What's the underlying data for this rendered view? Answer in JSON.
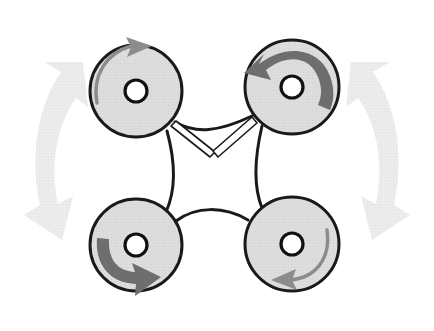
{
  "figure": {
    "name": "quadrotor-rotation-diagram",
    "background_color": "#ffffff",
    "width": 434,
    "height": 331,
    "caption": ""
  },
  "style": {
    "rotor_fill": "#dcdcdc",
    "rotor_stroke": "#1a1a1a",
    "rotor_stroke_width": 3,
    "hub_fill": "#ffffff",
    "hub_stroke": "#111111",
    "hub_stroke_width": 3.2,
    "frame_stroke": "#1a1a1a",
    "frame_stroke_width": 3,
    "strut_fill": "#ffffff",
    "strut_stroke": "#1a1a1a",
    "strut_stroke_width": 1.6,
    "thin_arrow_color": "#8c8c8c",
    "thick_arrow_color": "#6e6e6e",
    "yaw_arrow_color": "#e9e9e9"
  },
  "rotors": [
    {
      "id": "rotor-front-left",
      "label": "Front Left Rotor",
      "position": "top-left",
      "cx": 136,
      "cy": 91,
      "r": 46,
      "hub_r": 11,
      "spin": "clockwise",
      "arrow_style": "thin",
      "arrow_color": "#8c8c8c"
    },
    {
      "id": "rotor-front-right",
      "label": "Front Right Rotor",
      "position": "top-right",
      "cx": 292,
      "cy": 87,
      "r": 47,
      "hub_r": 11,
      "spin": "counter-clockwise",
      "arrow_style": "thick",
      "arrow_color": "#6e6e6e"
    },
    {
      "id": "rotor-rear-left",
      "label": "Rear Left Rotor",
      "position": "bottom-left",
      "cx": 136,
      "cy": 245,
      "r": 46,
      "hub_r": 11,
      "spin": "counter-clockwise",
      "arrow_style": "thick",
      "arrow_color": "#6e6e6e"
    },
    {
      "id": "rotor-rear-right",
      "label": "Rear Right Rotor",
      "position": "bottom-right",
      "cx": 292,
      "cy": 244,
      "r": 47,
      "hub_r": 11,
      "spin": "clockwise",
      "arrow_style": "thin",
      "arrow_color": "#8c8c8c"
    }
  ],
  "frame": {
    "label": "Airframe Body",
    "description": "Concave arc body linking the four rotor mounts",
    "struts": [
      {
        "id": "strut-left",
        "label": "Left Diagonal Strut"
      },
      {
        "id": "strut-right",
        "label": "Right Diagonal Strut"
      }
    ]
  },
  "yaw_arrows": [
    {
      "id": "yaw-arrow-left",
      "label": "Left Yaw Oscillation Arrow",
      "side": "left",
      "heads": 2,
      "color": "#e9e9e9"
    },
    {
      "id": "yaw-arrow-right",
      "label": "Right Yaw Oscillation Arrow",
      "side": "right",
      "heads": 2,
      "color": "#e9e9e9"
    }
  ]
}
